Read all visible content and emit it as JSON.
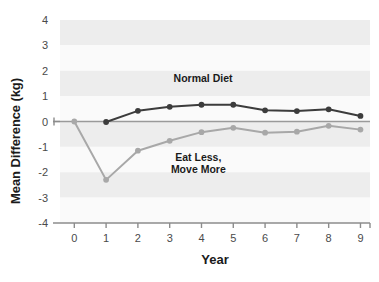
{
  "chart_data": {
    "type": "line",
    "title": "",
    "xlabel": "Year",
    "ylabel": "Mean Difference (kg)",
    "x": [
      0,
      1,
      2,
      3,
      4,
      5,
      6,
      7,
      8,
      9
    ],
    "xticklabels": [
      "0",
      "1",
      "2",
      "3",
      "4",
      "5",
      "6",
      "7",
      "8",
      "9"
    ],
    "yticklabels": [
      "4",
      "3",
      "2",
      "1",
      "0",
      "-1",
      "-2",
      "-3",
      "-4"
    ],
    "yticks": [
      4,
      3,
      2,
      1,
      0,
      -1,
      -2,
      -3,
      -4
    ],
    "xlim": [
      -0.45,
      9.3
    ],
    "ylim": [
      -4,
      4
    ],
    "grid": "horizontal-bands",
    "legend_position": "inline-annotations",
    "zero_line": 0,
    "series": [
      {
        "name": "Normal Diet",
        "color": "#3c3c3c",
        "marker": "circle",
        "annotation": "Normal Diet",
        "annotation_x": 4.05,
        "annotation_y": 1.55,
        "x": [
          1,
          2,
          3,
          4,
          5,
          6,
          7,
          8,
          9
        ],
        "values": [
          -0.02,
          0.42,
          0.58,
          0.66,
          0.66,
          0.44,
          0.41,
          0.48,
          0.22
        ]
      },
      {
        "name": "Eat Less, Move More",
        "color": "#a8a8a8",
        "marker": "circle",
        "annotation_line1": "Eat Less,",
        "annotation_line2": "Move More",
        "annotation_x": 3.9,
        "annotation_y": -1.55,
        "x": [
          0,
          1,
          2,
          3,
          4,
          5,
          6,
          7,
          8,
          9
        ],
        "values": [
          0.0,
          -2.3,
          -1.15,
          -0.76,
          -0.42,
          -0.25,
          -0.44,
          -0.4,
          -0.17,
          -0.32
        ]
      }
    ],
    "colors": {
      "normal_diet": "#3c3c3c",
      "eat_less_move_more": "#a8a8a8",
      "band_light": "#fafafa",
      "band_dark": "#ededed",
      "axis": "#8c8c8c",
      "tick_text": "#4a4a4a",
      "label_text": "#1a1a1a",
      "background": "#ffffff"
    }
  }
}
